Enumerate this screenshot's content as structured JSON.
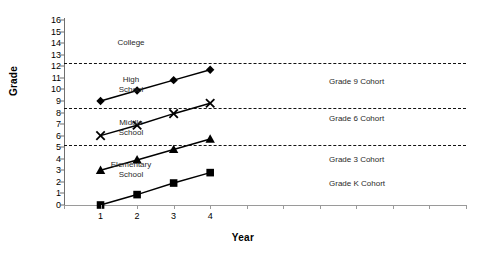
{
  "chart_data": {
    "type": "line",
    "title": "",
    "xlabel": "Year",
    "ylabel": "Grade",
    "xlim": [
      0,
      11
    ],
    "ylim": [
      0,
      16
    ],
    "grid": false,
    "legend_position": "inline-right-of-series",
    "x": [
      1,
      2,
      3,
      4
    ],
    "xtick_labels": [
      "1",
      "2",
      "3",
      "4"
    ],
    "ytick_labels": [
      "0",
      "1",
      "2",
      "3",
      "4",
      "5",
      "6",
      "7",
      "8",
      "9",
      "10",
      "11",
      "12",
      "13",
      "14",
      "15",
      "16"
    ],
    "series": [
      {
        "name": "Grade 9 Cohort",
        "marker": "filled-diamond",
        "values": [
          9.0,
          9.9,
          10.8,
          11.7
        ]
      },
      {
        "name": "Grade 6 Cohort",
        "marker": "cross-x",
        "values": [
          6.0,
          6.9,
          7.9,
          8.8
        ]
      },
      {
        "name": "Grade 3 Cohort",
        "marker": "filled-triangle",
        "values": [
          3.0,
          3.9,
          4.8,
          5.7
        ]
      },
      {
        "name": "Grade K Cohort",
        "marker": "filled-square",
        "values": [
          0.0,
          0.9,
          1.9,
          2.8
        ]
      }
    ],
    "band_lines": [
      12.3,
      8.4,
      5.2
    ],
    "band_labels": [
      {
        "text": "College",
        "y": 14.0
      },
      {
        "text": "High\nSchool",
        "y": 10.4
      },
      {
        "text": "Middle\nSchool",
        "y": 6.7
      },
      {
        "text": "Elementary\nSchool",
        "y": 3.0
      }
    ],
    "series_label_positions": [
      {
        "text": "Grade 9 Cohort",
        "y": 10.6
      },
      {
        "text": "Grade 6 Cohort",
        "y": 7.4
      },
      {
        "text": "Grade 3 Cohort",
        "y": 3.9
      },
      {
        "text": "Grade K Cohort",
        "y": 1.8
      }
    ],
    "colors": {
      "ink": "#000000",
      "axis": "#8a8a8a",
      "label": "#2a2a2a"
    }
  }
}
